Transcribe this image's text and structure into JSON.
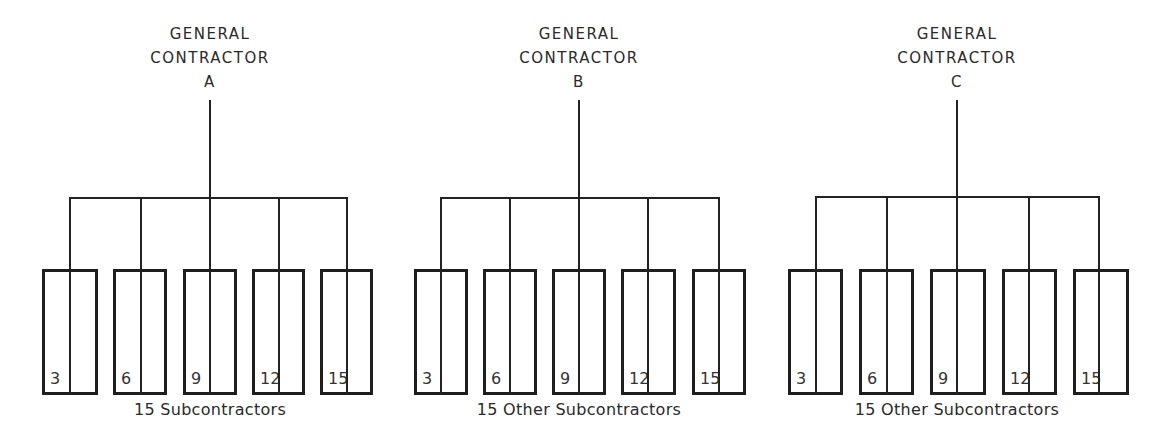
{
  "diagram": {
    "groups": [
      {
        "title_line1": "GENERAL",
        "title_line2": "CONTRACTOR",
        "title_letter": "A",
        "center_x": 210,
        "bar_left": 70,
        "bar_right": 347,
        "bar_y": 197,
        "boxes": [
          {
            "left": 42,
            "right": 98,
            "line_x": 70,
            "label": "3"
          },
          {
            "left": 113,
            "right": 167,
            "line_x": 141,
            "label": "6"
          },
          {
            "left": 183,
            "right": 237,
            "line_x": 210,
            "label": "9"
          },
          {
            "left": 252,
            "right": 305,
            "line_x": 279,
            "label": "12"
          },
          {
            "left": 320,
            "right": 373,
            "line_x": 347,
            "label": "15"
          }
        ],
        "caption": "15 Subcontractors"
      },
      {
        "title_line1": "GENERAL",
        "title_line2": "CONTRACTOR",
        "title_letter": "B",
        "center_x": 579,
        "bar_left": 441,
        "bar_right": 719,
        "bar_y": 197,
        "boxes": [
          {
            "left": 414,
            "right": 468,
            "line_x": 441,
            "label": "3"
          },
          {
            "left": 483,
            "right": 537,
            "line_x": 510,
            "label": "6"
          },
          {
            "left": 552,
            "right": 606,
            "line_x": 579,
            "label": "9"
          },
          {
            "left": 621,
            "right": 676,
            "line_x": 648,
            "label": "12"
          },
          {
            "left": 692,
            "right": 746,
            "line_x": 719,
            "label": "15"
          }
        ],
        "caption": "15 Other Subcontractors"
      },
      {
        "title_line1": "GENERAL",
        "title_line2": "CONTRACTOR",
        "title_letter": "C",
        "center_x": 957,
        "bar_left": 816,
        "bar_right": 1099,
        "bar_y": 196,
        "boxes": [
          {
            "left": 788,
            "right": 843,
            "line_x": 816,
            "label": "3"
          },
          {
            "left": 859,
            "right": 914,
            "line_x": 887,
            "label": "6"
          },
          {
            "left": 930,
            "right": 986,
            "line_x": 957,
            "label": "9"
          },
          {
            "left": 1002,
            "right": 1057,
            "line_x": 1029,
            "label": "12"
          },
          {
            "left": 1073,
            "right": 1129,
            "line_x": 1099,
            "label": "15"
          }
        ],
        "caption": "15 Other Subcontractors"
      }
    ]
  }
}
